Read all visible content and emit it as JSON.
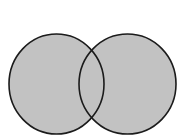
{
  "figure": {
    "width": 184,
    "height": 139,
    "background_color": "#ffffff",
    "title": "OR",
    "title_color": "#111111"
  },
  "chart_data": {
    "type": "venn",
    "title": "OR",
    "subtitle": "",
    "xlabel": "",
    "ylabel": "",
    "legend_position": "none",
    "grid": false,
    "operation": "OR",
    "shaded_regions": [
      "left-only",
      "overlap",
      "right-only"
    ],
    "sets": [
      {
        "name": "left-circle",
        "label": "",
        "center_x": 56.5,
        "center_y": 84,
        "radius_x": 47.5,
        "radius_y": 50,
        "fill_color": "#c2c2c2",
        "stroke_color": "#1b1b1b",
        "stroke_width": 1.6,
        "shaded": true
      },
      {
        "name": "right-circle",
        "label": "",
        "center_x": 127.5,
        "center_y": 84,
        "radius_x": 48.5,
        "radius_y": 50,
        "fill_color": "#c2c2c2",
        "stroke_color": "#1b1b1b",
        "stroke_width": 1.6,
        "shaded": true
      }
    ],
    "intersection": {
      "name": "overlap-region",
      "fill_color": "#c2c2c2",
      "shaded": true,
      "top_point": [
        92,
        43
      ],
      "bottom_point": [
        92,
        125
      ]
    },
    "colors": {
      "fill": "#c2c2c2",
      "stroke": "#1b1b1b",
      "background": "#ffffff",
      "title": "#111111"
    }
  }
}
